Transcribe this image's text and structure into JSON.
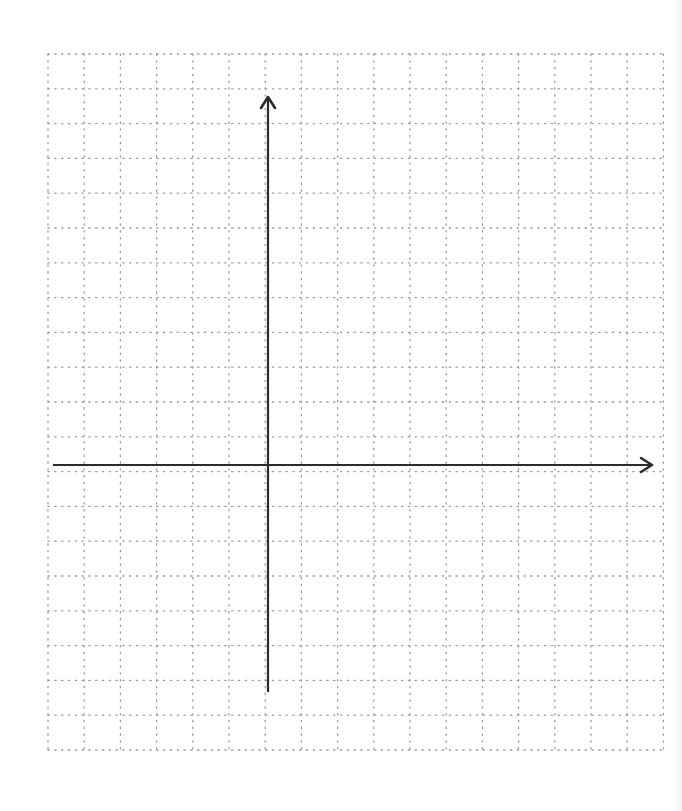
{
  "diagram": {
    "type": "coordinate-plane",
    "grid": {
      "left": 48,
      "top": 54,
      "columns": 17,
      "rows": 20,
      "cell_width": 36.2,
      "cell_height": 34.8,
      "line_style": "dotted",
      "line_color": "#9a9a9a"
    },
    "x_axis": {
      "y": 465,
      "x_start": 53,
      "x_end": 652,
      "arrow": "right",
      "color": "#2b2b2b"
    },
    "y_axis": {
      "x": 268,
      "y_start": 692,
      "y_end": 97,
      "arrow": "up",
      "color": "#2b2b2b"
    },
    "labels": []
  }
}
